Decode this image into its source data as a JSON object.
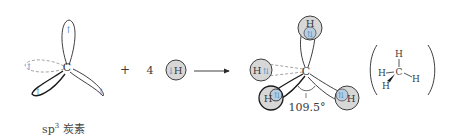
{
  "diagram": {
    "colors": {
      "line": "#2a2a2a",
      "dashed": "#9a9a9a",
      "electron": "#4a8fc7",
      "h_fill": "#d7d7d7",
      "h_overlap": "#b9cde0",
      "text": "#3a3a3a"
    },
    "left": {
      "atom_label": "C",
      "caption_main": "sp",
      "caption_sup": "3",
      "caption_rest": " 炭素"
    },
    "operator_plus": "+",
    "coefficient": "4",
    "h_atom_label": "H",
    "right": {
      "atom_label": "C",
      "h_labels": [
        "H",
        "H",
        "H",
        "H"
      ],
      "angle_label": "109.5°"
    },
    "structure": {
      "center": "C",
      "top": "H",
      "left": "H",
      "right": "H",
      "wedge": "H"
    }
  }
}
